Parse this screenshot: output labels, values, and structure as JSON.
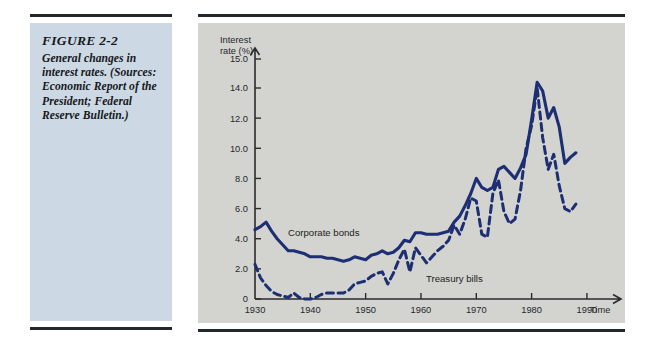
{
  "caption": {
    "figure_number": "FIGURE 2-2",
    "text": "General changes in interest rates. (Sources: Economic Report of the President; Federal Reserve Bulletin.)"
  },
  "chart_data": {
    "type": "line",
    "title": "",
    "ylabel": "Interest rate (%)",
    "xlabel": "Time",
    "xlim": [
      1930,
      1992
    ],
    "ylim": [
      0,
      15
    ],
    "grid": false,
    "legend": "inline-annotations",
    "ytick_labels": [
      "0",
      "2.0",
      "4.0",
      "6.0",
      "8.0",
      "10.0",
      "12.0",
      "14.0",
      "15.0"
    ],
    "ytick_values": [
      0,
      2.0,
      4.0,
      6.0,
      8.0,
      10.0,
      12.0,
      14.0,
      15.0
    ],
    "xtick_labels": [
      "1930",
      "1940",
      "1950",
      "1960",
      "1970",
      "1980",
      "1990"
    ],
    "xtick_values": [
      1930,
      1940,
      1950,
      1960,
      1970,
      1980,
      1990
    ],
    "axis_note": "Vertical scale is compressed between 14.0 and 15.0",
    "series": [
      {
        "name": "Corporate bonds",
        "style": "solid",
        "color": "#1d2f72",
        "x": [
          1930,
          1931,
          1932,
          1933,
          1934,
          1935,
          1936,
          1937,
          1938,
          1939,
          1940,
          1941,
          1942,
          1943,
          1944,
          1945,
          1946,
          1947,
          1948,
          1949,
          1950,
          1951,
          1952,
          1953,
          1954,
          1955,
          1956,
          1957,
          1958,
          1959,
          1960,
          1961,
          1962,
          1963,
          1964,
          1965,
          1966,
          1967,
          1968,
          1969,
          1970,
          1971,
          1972,
          1973,
          1974,
          1975,
          1976,
          1977,
          1978,
          1979,
          1980,
          1981,
          1982,
          1983,
          1984,
          1985,
          1986,
          1987,
          1988
        ],
        "values": [
          4.6,
          4.8,
          5.1,
          4.5,
          4.0,
          3.6,
          3.2,
          3.2,
          3.1,
          3.0,
          2.8,
          2.8,
          2.8,
          2.7,
          2.7,
          2.6,
          2.5,
          2.6,
          2.8,
          2.7,
          2.6,
          2.9,
          3.0,
          3.2,
          3.0,
          3.1,
          3.4,
          3.9,
          3.8,
          4.4,
          4.4,
          4.3,
          4.3,
          4.3,
          4.4,
          4.5,
          5.1,
          5.5,
          6.2,
          7.0,
          8.0,
          7.4,
          7.2,
          7.4,
          8.6,
          8.8,
          8.4,
          8.0,
          8.7,
          9.6,
          11.9,
          14.2,
          13.8,
          12.0,
          12.7,
          11.4,
          9.0,
          9.4,
          9.7
        ]
      },
      {
        "name": "Treasury bills",
        "style": "dashed",
        "color": "#1d2f72",
        "x": [
          1930,
          1931,
          1932,
          1933,
          1934,
          1935,
          1936,
          1937,
          1938,
          1939,
          1940,
          1941,
          1942,
          1943,
          1944,
          1945,
          1946,
          1947,
          1948,
          1949,
          1950,
          1951,
          1952,
          1953,
          1954,
          1955,
          1956,
          1957,
          1958,
          1959,
          1960,
          1961,
          1962,
          1963,
          1964,
          1965,
          1966,
          1967,
          1968,
          1969,
          1970,
          1971,
          1972,
          1973,
          1974,
          1975,
          1976,
          1977,
          1978,
          1979,
          1980,
          1981,
          1982,
          1983,
          1984,
          1985,
          1986,
          1987,
          1988
        ],
        "values": [
          2.3,
          1.4,
          0.9,
          0.5,
          0.3,
          0.2,
          0.1,
          0.4,
          0.1,
          0.0,
          0.0,
          0.1,
          0.3,
          0.4,
          0.4,
          0.4,
          0.4,
          0.6,
          1.0,
          1.1,
          1.2,
          1.5,
          1.7,
          1.8,
          1.0,
          1.7,
          2.6,
          3.3,
          1.8,
          3.4,
          2.9,
          2.4,
          2.8,
          3.2,
          3.5,
          3.9,
          4.9,
          4.3,
          5.3,
          6.7,
          6.5,
          4.3,
          4.1,
          7.0,
          7.9,
          5.8,
          5.0,
          5.3,
          7.2,
          10.0,
          11.5,
          14.0,
          10.7,
          8.6,
          9.6,
          7.5,
          6.0,
          5.8,
          6.3
        ]
      }
    ]
  }
}
